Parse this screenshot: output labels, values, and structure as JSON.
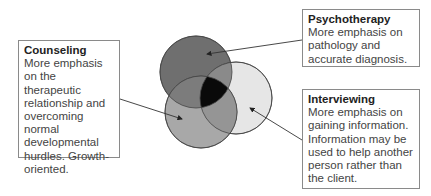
{
  "boxes": {
    "counseling": {
      "title": "Counseling",
      "text": "More emphasis on the therapeutic relationship and overcoming normal developmental hurdles. Growth-oriented."
    },
    "psychotherapy": {
      "title": "Psychotherapy",
      "text": "More emphasis on pathology and accurate diagnosis."
    },
    "interviewing": {
      "title": "Interviewing",
      "text": "More emphasis on gaining information. Information may be used to help another person rather than the client."
    }
  },
  "circles": [
    {
      "name": "psychotherapy",
      "fill": "#6f6f6f"
    },
    {
      "name": "interviewing",
      "fill": "#e4e4e4"
    },
    {
      "name": "counseling",
      "fill": "#a6a6a6"
    }
  ]
}
